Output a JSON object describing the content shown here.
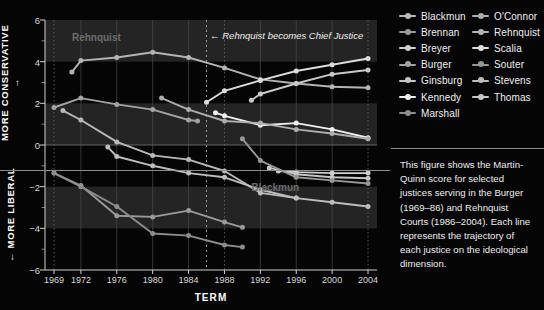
{
  "top_sliver_text": "",
  "chart_data": {
    "type": "line",
    "title": "",
    "xlabel": "TERM",
    "ylabel_top": "MORE CONSERVATIVE →",
    "ylabel_bottom": "← MORE LIBERAL",
    "xlim": [
      1968,
      2005
    ],
    "ylim": [
      -6,
      6
    ],
    "yticks": [
      6,
      4,
      2,
      0,
      -2,
      -4,
      -6
    ],
    "ytick_labels": [
      "6",
      "4",
      "2",
      "0",
      "−2",
      "−4",
      "−6"
    ],
    "yminor": [
      5,
      3,
      1,
      -1,
      -3,
      -5
    ],
    "xticks": [
      1969,
      1972,
      1976,
      1980,
      1984,
      1988,
      1992,
      1996,
      2000,
      2004
    ],
    "xtick_labels": [
      "1969",
      "1972",
      "1976",
      "1980",
      "1984",
      "1988",
      "1992",
      "1996",
      "2000",
      "2004"
    ],
    "grid": "banded-horizontal-and-vertical",
    "legend_position": "right-top",
    "annotations": [
      {
        "name": "rehnquist-chief-justice",
        "text": "← Rehnquist becomes Chief Justice",
        "x": 1986.4,
        "y": 5.2
      },
      {
        "name": "rehnquist-series-label",
        "text": "Rehnquist",
        "x": 1971.0,
        "y": 5.1,
        "color": "#6d6d6d"
      },
      {
        "name": "blackmun-series-label",
        "text": "Blackmun",
        "x": 1991.0,
        "y": -2.1,
        "color": "#6d6d6d"
      }
    ],
    "vlines": [
      {
        "name": "rehnquist-cj-line",
        "x": 1986,
        "style": "dashed"
      }
    ],
    "series": [
      {
        "name": "Blackmun",
        "color": "#b9b9b9",
        "x": [
          1970,
          1972,
          1976,
          1980,
          1984,
          1988,
          1992,
          1996,
          2000,
          2004
        ],
        "values": [
          1.65,
          1.2,
          0.15,
          -0.5,
          -0.7,
          -1.25,
          -2.3,
          -2.55,
          null,
          null
        ]
      },
      {
        "name": "Brennan",
        "color": "#9a9a9a",
        "x": [
          1969,
          1972,
          1976,
          1980,
          1984,
          1988,
          1990
        ],
        "values": [
          -1.35,
          -1.95,
          -3.4,
          -3.45,
          -3.15,
          -3.7,
          -3.95
        ]
      },
      {
        "name": "Breyer",
        "color": "#cfcfcf",
        "x": [
          1994,
          1996,
          2000,
          2004
        ],
        "values": [
          -1.25,
          -1.3,
          -1.35,
          -1.35
        ]
      },
      {
        "name": "Burger",
        "color": "#a3a3a3",
        "x": [
          1969,
          1972,
          1976,
          1980,
          1984,
          1985
        ],
        "values": [
          1.8,
          2.25,
          1.95,
          1.7,
          1.2,
          1.15
        ]
      },
      {
        "name": "Ginsburg",
        "color": "#c6c6c6",
        "x": [
          1993,
          1996,
          2000,
          2004
        ],
        "values": [
          -1.1,
          -1.4,
          -1.55,
          -1.6
        ]
      },
      {
        "name": "Kennedy",
        "color": "#efefef",
        "x": [
          1987,
          1988,
          1992,
          1996,
          2000,
          2004
        ],
        "values": [
          1.55,
          1.4,
          0.95,
          1.05,
          0.75,
          0.35
        ]
      },
      {
        "name": "Marshall",
        "color": "#8d8d8d",
        "x": [
          1969,
          1972,
          1976,
          1980,
          1984,
          1988,
          1990
        ],
        "values": [
          -1.35,
          -2.0,
          -2.95,
          -4.25,
          -4.35,
          -4.8,
          -4.9
        ]
      },
      {
        "name": "O'Connor",
        "color": "#adadad",
        "x": [
          1981,
          1984,
          1988,
          1992,
          1996,
          2000,
          2004
        ],
        "values": [
          2.25,
          1.7,
          1.15,
          1.05,
          0.75,
          0.55,
          0.3
        ]
      },
      {
        "name": "Rehnquist",
        "color": "#b4b4b4",
        "x": [
          1971,
          1972,
          1976,
          1980,
          1984,
          1988,
          1992,
          1996,
          2000,
          2004
        ],
        "values": [
          3.5,
          4.05,
          4.2,
          4.45,
          4.2,
          3.7,
          3.15,
          2.95,
          2.8,
          2.75
        ]
      },
      {
        "name": "Scalia",
        "color": "#dcdcdc",
        "x": [
          1986,
          1988,
          1992,
          1996,
          2000,
          2004
        ],
        "values": [
          2.05,
          2.6,
          3.1,
          3.55,
          3.85,
          4.15
        ]
      },
      {
        "name": "Souter",
        "color": "#979797",
        "x": [
          1990,
          1992,
          1996,
          2000,
          2004
        ],
        "values": [
          0.3,
          -0.75,
          -1.55,
          -1.7,
          -1.85
        ]
      },
      {
        "name": "Stevens",
        "color": "#bdbdbd",
        "x": [
          1975,
          1976,
          1980,
          1984,
          1988,
          1992,
          1996,
          2000,
          2004
        ],
        "values": [
          -0.1,
          -0.55,
          -1.0,
          -1.35,
          -1.55,
          -2.15,
          -2.55,
          -2.75,
          -2.95
        ]
      },
      {
        "name": "Thomas",
        "color": "#c9c9c9",
        "x": [
          1991,
          1992,
          1996,
          2000,
          2004
        ],
        "values": [
          2.15,
          2.45,
          2.95,
          3.4,
          3.6
        ]
      }
    ]
  },
  "legend": {
    "col1": [
      {
        "label": "Blackmun",
        "color": "#b9b9b9"
      },
      {
        "label": "Brennan",
        "color": "#9a9a9a"
      },
      {
        "label": "Breyer",
        "color": "#cfcfcf"
      },
      {
        "label": "Burger",
        "color": "#a3a3a3"
      },
      {
        "label": "Ginsburg",
        "color": "#c6c6c6"
      },
      {
        "label": "Kennedy",
        "color": "#efefef"
      },
      {
        "label": "Marshall",
        "color": "#8d8d8d"
      }
    ],
    "col2": [
      {
        "label": "O'Connor",
        "color": "#adadad"
      },
      {
        "label": "Rehnquist",
        "color": "#b4b4b4"
      },
      {
        "label": "Scalia",
        "color": "#dcdcdc"
      },
      {
        "label": "Souter",
        "color": "#979797"
      },
      {
        "label": "Stevens",
        "color": "#bdbdbd"
      },
      {
        "label": "Thomas",
        "color": "#c9c9c9"
      }
    ]
  },
  "caption": {
    "text": "This figure shows the Martin-Quinn score for selected justices serving in the Burger (1969–86) and Rehnquist Courts (1986–2004). Each line represents the trajectory of each justice on the ideological dimension."
  }
}
